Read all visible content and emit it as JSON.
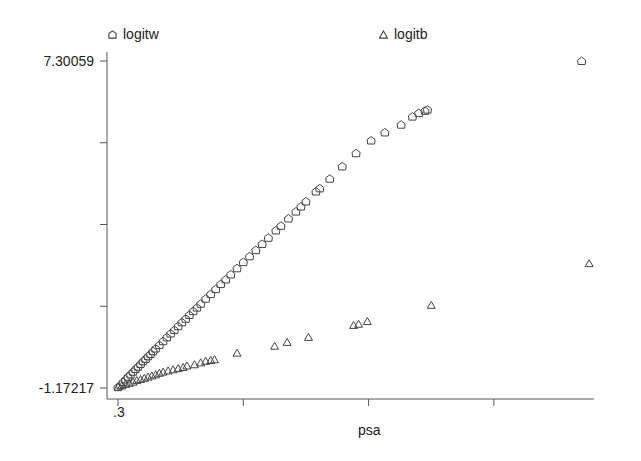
{
  "chart_data": {
    "type": "scatter",
    "title": "",
    "xlabel": "psa",
    "ylabel": "",
    "x_tick_labels": [
      ".3",
      "",
      "",
      ""
    ],
    "y_tick_labels": [
      "7.30059",
      "",
      "",
      "",
      "-1.17217"
    ],
    "ylim": [
      -1.17217,
      7.30059
    ],
    "legend_position": "top",
    "grid": false,
    "x_units_note": "x given as tick index (0 = .3, each unit = one tick interval)",
    "series": [
      {
        "name": "logitw",
        "marker": "pentagon",
        "points": [
          [
            0.0,
            -1.15
          ],
          [
            0.02,
            -1.1
          ],
          [
            0.04,
            -1.02
          ],
          [
            0.06,
            -0.95
          ],
          [
            0.08,
            -0.88
          ],
          [
            0.1,
            -0.82
          ],
          [
            0.12,
            -0.75
          ],
          [
            0.14,
            -0.68
          ],
          [
            0.16,
            -0.62
          ],
          [
            0.18,
            -0.55
          ],
          [
            0.2,
            -0.48
          ],
          [
            0.22,
            -0.42
          ],
          [
            0.24,
            -0.35
          ],
          [
            0.26,
            -0.29
          ],
          [
            0.28,
            -0.22
          ],
          [
            0.3,
            -0.15
          ],
          [
            0.33,
            -0.06
          ],
          [
            0.36,
            0.04
          ],
          [
            0.39,
            0.14
          ],
          [
            0.42,
            0.24
          ],
          [
            0.45,
            0.33
          ],
          [
            0.48,
            0.43
          ],
          [
            0.51,
            0.53
          ],
          [
            0.54,
            0.62
          ],
          [
            0.57,
            0.72
          ],
          [
            0.6,
            0.82
          ],
          [
            0.63,
            0.91
          ],
          [
            0.66,
            1.01
          ],
          [
            0.7,
            1.14
          ],
          [
            0.74,
            1.26
          ],
          [
            0.78,
            1.39
          ],
          [
            0.82,
            1.52
          ],
          [
            0.86,
            1.64
          ],
          [
            0.9,
            1.77
          ],
          [
            0.95,
            1.93
          ],
          [
            1.0,
            2.09
          ],
          [
            1.05,
            2.24
          ],
          [
            1.1,
            2.4
          ],
          [
            1.15,
            2.56
          ],
          [
            1.2,
            2.72
          ],
          [
            1.26,
            2.91
          ],
          [
            1.3,
            3.03
          ],
          [
            1.36,
            3.22
          ],
          [
            1.42,
            3.4
          ],
          [
            1.46,
            3.53
          ],
          [
            1.5,
            3.66
          ],
          [
            1.58,
            3.92
          ],
          [
            1.61,
            4.0
          ],
          [
            1.69,
            4.25
          ],
          [
            1.79,
            4.57
          ],
          [
            1.9,
            4.91
          ],
          [
            2.02,
            5.24
          ],
          [
            2.13,
            5.45
          ],
          [
            2.26,
            5.65
          ],
          [
            2.35,
            5.86
          ],
          [
            2.4,
            5.95
          ],
          [
            2.45,
            6.01
          ],
          [
            2.47,
            6.04
          ],
          [
            3.7,
            7.3
          ]
        ]
      },
      {
        "name": "logitb",
        "marker": "triangle",
        "points": [
          [
            0.0,
            -1.15
          ],
          [
            0.03,
            -1.12
          ],
          [
            0.06,
            -1.08
          ],
          [
            0.09,
            -1.05
          ],
          [
            0.12,
            -1.02
          ],
          [
            0.15,
            -0.98
          ],
          [
            0.18,
            -0.95
          ],
          [
            0.21,
            -0.92
          ],
          [
            0.24,
            -0.89
          ],
          [
            0.27,
            -0.86
          ],
          [
            0.3,
            -0.83
          ],
          [
            0.33,
            -0.79
          ],
          [
            0.36,
            -0.76
          ],
          [
            0.4,
            -0.73
          ],
          [
            0.44,
            -0.7
          ],
          [
            0.48,
            -0.67
          ],
          [
            0.52,
            -0.64
          ],
          [
            0.55,
            -0.6
          ],
          [
            0.61,
            -0.57
          ],
          [
            0.66,
            -0.52
          ],
          [
            0.7,
            -0.48
          ],
          [
            0.74,
            -0.46
          ],
          [
            0.77,
            -0.44
          ],
          [
            0.95,
            -0.27
          ],
          [
            1.25,
            -0.09
          ],
          [
            1.35,
            0.01
          ],
          [
            1.52,
            0.14
          ],
          [
            1.88,
            0.45
          ],
          [
            1.92,
            0.48
          ],
          [
            1.99,
            0.55
          ],
          [
            2.5,
            0.97
          ],
          [
            3.76,
            2.05
          ]
        ]
      }
    ]
  },
  "legend": {
    "items": [
      {
        "label": "logitw",
        "symbol": "pentagon"
      },
      {
        "label": "logitb",
        "symbol": "triangle"
      }
    ]
  },
  "axes": {
    "y_top_label": "7.30059",
    "y_bottom_label": "-1.17217",
    "x_first_label": ".3",
    "x_title": "psa"
  },
  "colors": {
    "axis": "#555555",
    "marker": "#444444",
    "text": "#222222",
    "background": "#ffffff"
  }
}
